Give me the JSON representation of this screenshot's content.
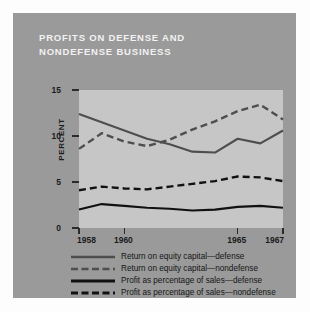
{
  "card": {
    "background_color": "#9a9a9a",
    "plot_background_color": "#c6c6c6"
  },
  "title": {
    "line1": "PROFITS ON DEFENSE AND",
    "line2": "NONDEFENSE BUSINESS",
    "color": "#f2f2f2"
  },
  "axes": {
    "ylabel": "PERCENT",
    "yticks": [
      "0",
      "5",
      "10",
      "15"
    ],
    "ytick_values": [
      0,
      5,
      10,
      15
    ],
    "xticks": [
      "1958",
      "1960",
      "1965",
      "1967"
    ],
    "xtick_values": [
      1958,
      1960,
      1965,
      1967
    ]
  },
  "legend": {
    "items": [
      {
        "label": "Return on equity capital—defense",
        "color": "#4e4e4e",
        "style": "solid",
        "swatch_name": "legend-swatch-equity-defense"
      },
      {
        "label": "Return on equity capital—nondefense",
        "color": "#4e4e4e",
        "style": "dashed",
        "swatch_name": "legend-swatch-equity-nondefense"
      },
      {
        "label": "Profit as percentage of sales—defense",
        "color": "#111111",
        "style": "solid",
        "swatch_name": "legend-swatch-sales-defense"
      },
      {
        "label": "Profit as percentage of sales—nondefense",
        "color": "#111111",
        "style": "dashed",
        "swatch_name": "legend-swatch-sales-nondefense"
      }
    ]
  },
  "chart_data": {
    "type": "line",
    "title": "PROFITS ON DEFENSE AND NONDEFENSE BUSINESS",
    "xlabel": "",
    "ylabel": "PERCENT",
    "xlim": [
      1958,
      1967
    ],
    "ylim": [
      0,
      15
    ],
    "ytick_labels": [
      "0",
      "5",
      "10",
      "15"
    ],
    "xtick_labels": [
      "1958",
      "1960",
      "1965",
      "1967"
    ],
    "grid": false,
    "legend_position": "below",
    "x": [
      1958,
      1959,
      1960,
      1961,
      1962,
      1963,
      1964,
      1965,
      1966,
      1967
    ],
    "series": [
      {
        "name": "Return on equity capital—defense",
        "color": "#4e4e4e",
        "style": "solid",
        "values": [
          12.4,
          11.5,
          10.6,
          9.7,
          9.1,
          8.3,
          8.2,
          9.7,
          9.2,
          10.6
        ]
      },
      {
        "name": "Return on equity capital—nondefense",
        "color": "#4e4e4e",
        "style": "dashed",
        "values": [
          8.6,
          10.3,
          9.4,
          8.9,
          9.6,
          10.7,
          11.6,
          12.7,
          13.4,
          11.8
        ]
      },
      {
        "name": "Profit as percentage of sales—defense",
        "color": "#111111",
        "style": "solid",
        "values": [
          2.0,
          2.6,
          2.4,
          2.2,
          2.1,
          1.9,
          2.0,
          2.3,
          2.4,
          2.2
        ]
      },
      {
        "name": "Profit as percentage of sales—nondefense",
        "color": "#111111",
        "style": "dashed",
        "values": [
          4.1,
          4.5,
          4.3,
          4.2,
          4.5,
          4.8,
          5.1,
          5.6,
          5.5,
          5.1
        ]
      }
    ]
  }
}
